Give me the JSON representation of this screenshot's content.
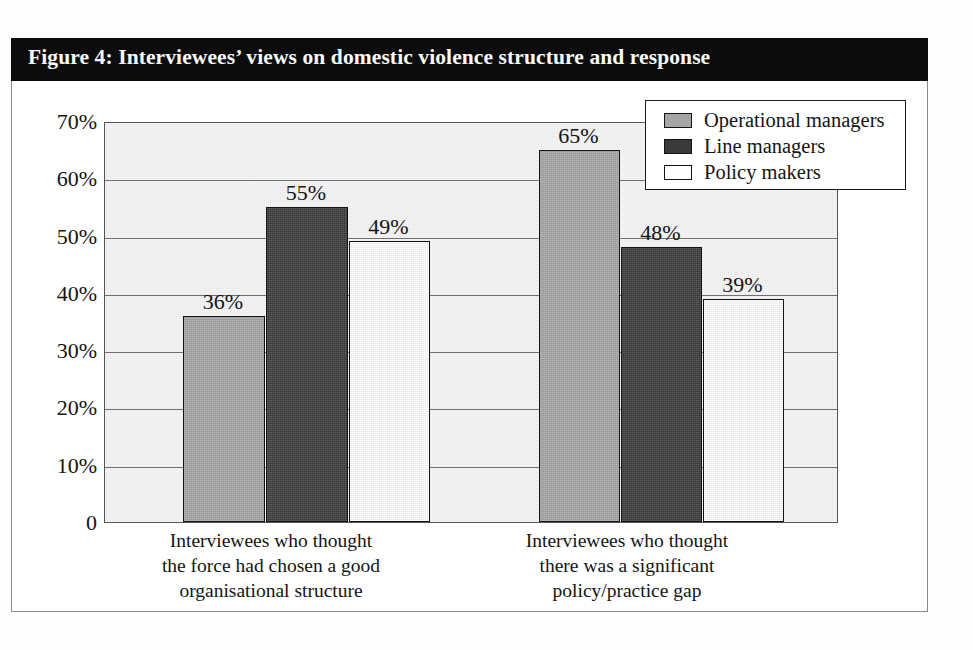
{
  "figure": {
    "title": "Figure 4: Interviewees’ views on domestic violence structure and response"
  },
  "colors": {
    "banner_background": "#0c0c0c",
    "banner_text": "#fbfbfb",
    "plot_background": "#e9e9e9",
    "frame_border": "#8a8a8a",
    "axis_border": "#555555",
    "gridline": "#6f6f6f",
    "series_operational_managers": "#a5a5a5",
    "series_line_managers": "#3a3a3a",
    "series_policy_makers": "#ffffff",
    "text": "#141414"
  },
  "legend": {
    "position": "top-right-inside-plot",
    "entries": [
      {
        "label": "Operational managers",
        "swatch": "#a5a5a5",
        "icon": "legend-swatch-icon"
      },
      {
        "label": "Line managers",
        "swatch": "#3a3a3a",
        "icon": "legend-swatch-icon"
      },
      {
        "label": "Policy makers",
        "swatch": "#ffffff",
        "icon": "legend-swatch-icon"
      }
    ]
  },
  "y_axis": {
    "ticks": [
      "70%",
      "60%",
      "50%",
      "40%",
      "30%",
      "20%",
      "10%",
      "0"
    ],
    "tick_values": [
      70,
      60,
      50,
      40,
      30,
      20,
      10,
      0
    ],
    "min": 0,
    "max": 70,
    "step": 10,
    "label": ""
  },
  "x_axis": {
    "label": "",
    "categories": [
      {
        "lines": [
          "Interviewees who thought",
          "the force had chosen a good",
          "organisational structure"
        ],
        "full": "Interviewees who thought the force had chosen a good organisational structure"
      },
      {
        "lines": [
          "Interviewees who thought",
          "there was a significant",
          "policy/practice gap"
        ],
        "full": "Interviewees who thought there was a significant policy/practice gap"
      }
    ]
  },
  "bars": [
    {
      "group": 0,
      "series": "Operational managers",
      "value": 36,
      "label": "36%",
      "x": 78,
      "width": 82,
      "cls": "series-op"
    },
    {
      "group": 0,
      "series": "Line managers",
      "value": 55,
      "label": "55%",
      "x": 161,
      "width": 82,
      "cls": "series-line"
    },
    {
      "group": 0,
      "series": "Policy makers",
      "value": 49,
      "label": "49%",
      "x": 244,
      "width": 81,
      "cls": "series-pol"
    },
    {
      "group": 1,
      "series": "Operational managers",
      "value": 65,
      "label": "65%",
      "x": 434,
      "width": 81,
      "cls": "series-op"
    },
    {
      "group": 1,
      "series": "Line managers",
      "value": 48,
      "label": "48%",
      "x": 516,
      "width": 81,
      "cls": "series-line"
    },
    {
      "group": 1,
      "series": "Policy makers",
      "value": 39,
      "label": "39%",
      "x": 598,
      "width": 81,
      "cls": "series-pol"
    }
  ],
  "category_label_positions": [
    {
      "left": 110,
      "width": 300
    },
    {
      "left": 466,
      "width": 300
    }
  ],
  "chart_data": {
    "type": "bar",
    "title": "Figure 4: Interviewees’ views on domestic violence structure and response",
    "subtitle": "",
    "xlabel": "",
    "ylabel": "",
    "categories": [
      "Interviewees who thought the force had chosen a good organisational structure",
      "Interviewees who thought there was a significant policy/practice gap"
    ],
    "series": [
      {
        "name": "Operational managers",
        "values": [
          36,
          65
        ],
        "color": "#a5a5a5"
      },
      {
        "name": "Line managers",
        "values": [
          55,
          48
        ],
        "color": "#3a3a3a"
      },
      {
        "name": "Policy makers",
        "values": [
          49,
          39
        ],
        "color": "#ffffff"
      }
    ],
    "data_labels": [
      "36%",
      "55%",
      "49%",
      "65%",
      "48%",
      "39%"
    ],
    "value_unit": "percent",
    "ylim": [
      0,
      70
    ],
    "ytick_labels": [
      "0",
      "10%",
      "20%",
      "30%",
      "40%",
      "50%",
      "60%",
      "70%"
    ],
    "ytick_step": 10,
    "grid": "horizontal",
    "legend_position": "top right",
    "orientation": "vertical",
    "grouped": true
  }
}
